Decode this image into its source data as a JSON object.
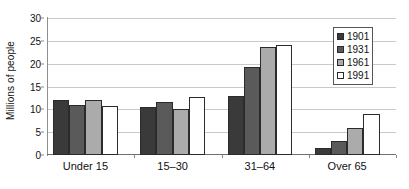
{
  "chart_data": {
    "type": "bar",
    "title": "",
    "subtitle": "",
    "xlabel": "",
    "ylabel": "Millions of people",
    "ylim": [
      0,
      30
    ],
    "yticks": [
      0,
      5,
      10,
      15,
      20,
      25,
      30
    ],
    "ytick_labels": [
      "0",
      "5",
      "10",
      "15",
      "20",
      "25",
      "30"
    ],
    "grid": "horizontal",
    "legend_position": "top-right-inside",
    "categories": [
      "Under 15",
      "15–30",
      "31–64",
      "Over 65"
    ],
    "series": [
      {
        "name": "1901",
        "color": "#3a3a3a",
        "values": [
          12.1,
          10.5,
          12.9,
          1.5
        ]
      },
      {
        "name": "1931",
        "color": "#5a5a5a",
        "values": [
          11.0,
          11.5,
          19.3,
          3.1
        ]
      },
      {
        "name": "1961",
        "color": "#ababab",
        "values": [
          12.1,
          10.0,
          23.6,
          5.9
        ]
      },
      {
        "name": "1991",
        "color": "#ffffff",
        "values": [
          10.7,
          12.7,
          24.2,
          8.9
        ]
      }
    ],
    "annotations": []
  },
  "legend": {
    "items": [
      {
        "label": "1901"
      },
      {
        "label": "1931"
      },
      {
        "label": "1961"
      },
      {
        "label": "1991"
      }
    ]
  }
}
